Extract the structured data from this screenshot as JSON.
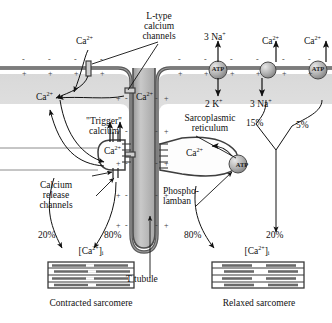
{
  "figure": {
    "colors": {
      "ink": "#111111",
      "membrane": "#555555",
      "cytoplasm_band": "#dcdcdc",
      "tubule_fill": "#b9b9b9",
      "pump_fill": "#b0b0b0",
      "filament": "#6a6a6a"
    }
  },
  "labels": {
    "l_type_channels": "L-type\ncalcium\nchannels",
    "l_type_l1": "L-type",
    "l_type_l2": "calcium",
    "l_type_l3": "channels",
    "ca_extracellular": "Ca2+",
    "ca_trigger_in": "Ca2+",
    "trigger_l1": "\"Trigger\"",
    "trigger_l2": "calcium",
    "ca_sr_junction": "Ca2+",
    "ca_tubule": "Ca2+",
    "ca_sr_lumen": "Ca2+",
    "release_l1": "Calcium",
    "release_l2": "release",
    "release_l3": "channels",
    "sr_l1": "Sarcoplasmic",
    "sr_l2": "reticulum",
    "phospholamban_l1": "Phospho-",
    "phospholamban_l2": "lamban",
    "t_tubule": "T tubule",
    "na_out": "3 Na+",
    "k_in": "2 K+",
    "ca_exchanger_top": "Ca2+",
    "na_exchanger_in": "3 Na+",
    "ca_pump_top": "Ca2+",
    "pct_15": "15%",
    "pct_5": "5%",
    "pct_left_20": "20%",
    "pct_left_80": "80%",
    "pct_right_80": "80%",
    "pct_right_20": "20%",
    "ca_i_left": "[Ca2+]i",
    "ca_i_right": "[Ca2+]i",
    "contracted": "Contracted sarcomere",
    "relaxed": "Relaxed sarcomere",
    "ion_minus": "-",
    "ion_plus": "+",
    "atp_text": "ATP"
  },
  "membrane_charges": {
    "outer_sign": "-",
    "inner_sign": "+",
    "outer_x": [
      22,
      48,
      74,
      100,
      126,
      152,
      178,
      204,
      230,
      256,
      282,
      308
    ],
    "inner_x": [
      22,
      48,
      74,
      100,
      152,
      178,
      204,
      230,
      256,
      282,
      308
    ],
    "tubule_left_x": 128,
    "tubule_right_x": 160,
    "tubule_y": [
      95,
      128,
      160,
      192,
      222
    ]
  },
  "pumps": [
    {
      "name": "sodium-potassium-atpase",
      "label": "ATP",
      "cx": 218,
      "cy": 70,
      "r": 9,
      "has_text": true
    },
    {
      "name": "sodium-calcium-exchanger",
      "label": "",
      "cx": 268,
      "cy": 70,
      "r": 8,
      "has_text": false
    },
    {
      "name": "calcium-atpase-sarcolemma",
      "label": "ATP",
      "cx": 318,
      "cy": 70,
      "r": 9,
      "has_text": true
    },
    {
      "name": "serca-pump",
      "label": "ATP",
      "cx": 242,
      "cy": 166,
      "r": 9,
      "has_text": true
    }
  ],
  "chart_data": {
    "type": "diagram",
    "ca_sources_contracted": {
      "sarcolemma_influx": 20,
      "sr_release": 80,
      "unit": "%"
    },
    "ca_removal_relaxed": {
      "sr_uptake": 80,
      "sarcolemma_efflux": 20,
      "unit": "%"
    },
    "sarcolemmal_efflux_split": {
      "na_ca_exchanger": 15,
      "ca_atpase": 5,
      "unit": "%"
    },
    "na_k_pump_stoichiometry": {
      "na_out": 3,
      "k_in": 2
    },
    "na_ca_exchanger_stoichiometry": {
      "na_in": 3,
      "ca_out": 1
    }
  }
}
